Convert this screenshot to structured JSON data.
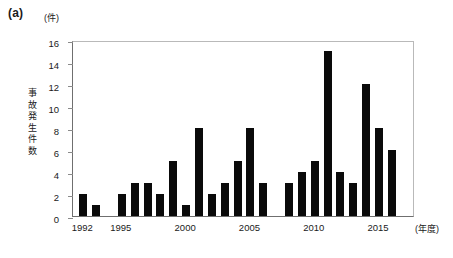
{
  "figure": {
    "panel_label": "(a)",
    "y_unit": "(件)",
    "x_unit": "(年度)",
    "y_axis_title": "事故発生件数",
    "y_axis_title_chars": [
      "事",
      "故",
      "発",
      "生",
      "件",
      "数"
    ],
    "bar_color": "#0a0a0a",
    "axis_color": "#6f6f6f",
    "background": "#ffffff"
  },
  "chart_data": {
    "type": "bar",
    "title": "",
    "subtitle": "",
    "xlabel": "(年度)",
    "ylabel": "事故発生件数",
    "y_unit": "(件)",
    "ylim": [
      0,
      16
    ],
    "ytick_labels": [
      "0",
      "2",
      "4",
      "6",
      "8",
      "10",
      "12",
      "14",
      "16"
    ],
    "yticks": [
      0,
      2,
      4,
      6,
      8,
      10,
      12,
      14,
      16
    ],
    "xtick_labels": [
      "1992",
      "1995",
      "2000",
      "2005",
      "2010",
      "2015"
    ],
    "xticks": [
      1992,
      1995,
      2000,
      2005,
      2010,
      2015
    ],
    "xlim": [
      1991.2,
      2017.8
    ],
    "grid": false,
    "legend": "none",
    "categories": [
      "1992",
      "1993",
      "1994",
      "1995",
      "1996",
      "1997",
      "1998",
      "1999",
      "2000",
      "2001",
      "2002",
      "2003",
      "2004",
      "2005",
      "2006",
      "2007",
      "2008",
      "2009",
      "2010",
      "2011",
      "2012",
      "2013",
      "2014",
      "2015",
      "2016",
      "2017"
    ],
    "values": [
      2,
      1,
      0,
      2,
      3,
      3,
      2,
      5,
      1,
      8,
      2,
      3,
      5,
      8,
      3,
      0,
      3,
      4,
      5,
      15,
      4,
      3,
      12,
      8,
      6,
      0
    ],
    "bars": [
      {
        "year": "1992",
        "value": 2
      },
      {
        "year": "1993",
        "value": 1
      },
      {
        "year": "1994",
        "value": 0
      },
      {
        "year": "1995",
        "value": 2
      },
      {
        "year": "1996",
        "value": 3
      },
      {
        "year": "1997",
        "value": 3
      },
      {
        "year": "1998",
        "value": 2
      },
      {
        "year": "1999",
        "value": 5
      },
      {
        "year": "2000",
        "value": 1
      },
      {
        "year": "2001",
        "value": 8
      },
      {
        "year": "2002",
        "value": 2
      },
      {
        "year": "2003",
        "value": 3
      },
      {
        "year": "2004",
        "value": 5
      },
      {
        "year": "2005",
        "value": 8
      },
      {
        "year": "2006",
        "value": 3
      },
      {
        "year": "2007",
        "value": 0
      },
      {
        "year": "2008",
        "value": 3
      },
      {
        "year": "2009",
        "value": 4
      },
      {
        "year": "2010",
        "value": 5
      },
      {
        "year": "2011",
        "value": 15
      },
      {
        "year": "2012",
        "value": 4
      },
      {
        "year": "2013",
        "value": 3
      },
      {
        "year": "2014",
        "value": 12
      },
      {
        "year": "2015",
        "value": 8
      },
      {
        "year": "2016",
        "value": 6
      }
    ]
  }
}
